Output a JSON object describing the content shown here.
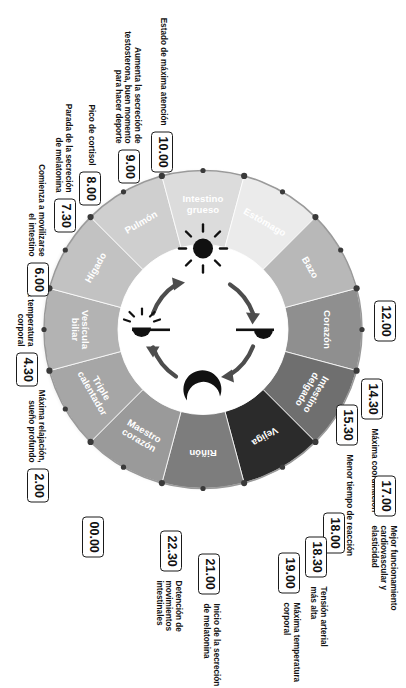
{
  "diagram": {
    "wheel": {
      "segments": [
        {
          "organ": "Corazón",
          "start_hour": 11,
          "end_hour": 13,
          "color": "#8f8f8f"
        },
        {
          "organ": "Intestino delgado",
          "start_hour": 13,
          "end_hour": 15,
          "color": "#6f6f6f"
        },
        {
          "organ": "Vejiga",
          "start_hour": 15,
          "end_hour": 17,
          "color": "#2b2b2b"
        },
        {
          "organ": "Riñón",
          "start_hour": 17,
          "end_hour": 19,
          "color": "#7d7d7d"
        },
        {
          "organ": "Maestro corazón",
          "start_hour": 19,
          "end_hour": 21,
          "color": "#9a9a9a"
        },
        {
          "organ": "Triple calentador",
          "start_hour": 21,
          "end_hour": 23,
          "color": "#a6a6a6"
        },
        {
          "organ": "Vesícula biliar",
          "start_hour": 23,
          "end_hour": 1,
          "color": "#b3b3b3"
        },
        {
          "organ": "Hígado",
          "start_hour": 1,
          "end_hour": 3,
          "color": "#c2c2c2"
        },
        {
          "organ": "Pulmón",
          "start_hour": 3,
          "end_hour": 5,
          "color": "#cfcfcf"
        },
        {
          "organ": "Intestino grueso",
          "start_hour": 5,
          "end_hour": 7,
          "color": "#dcdcdc"
        },
        {
          "organ": "Estómago",
          "start_hour": 7,
          "end_hour": 9,
          "color": "#ebebeb"
        },
        {
          "organ": "Bazo",
          "start_hour": 9,
          "end_hour": 11,
          "color": "#b8b8b8"
        }
      ],
      "center_icons": [
        {
          "name": "sunset-icon",
          "position": "top"
        },
        {
          "name": "moon-icon",
          "position": "right"
        },
        {
          "name": "sunrise-icon",
          "position": "bottom"
        },
        {
          "name": "sun-icon",
          "position": "left"
        }
      ],
      "center_arrows": 4
    },
    "markers": [
      {
        "time": "12.00",
        "note": ""
      },
      {
        "time": "14.30",
        "note": "Máxima coordinación"
      },
      {
        "time": "15.30",
        "note": "Menor tiempo de reacción"
      },
      {
        "time": "17.00",
        "note": "Mejor funcionamiento\ncardiovascular y\nelasticidad"
      },
      {
        "time": "18.00",
        "note": ""
      },
      {
        "time": "18.30",
        "note": "Tensión arterial\nmás alta"
      },
      {
        "time": "19.00",
        "note": "Máxima temperatura\ncorporal"
      },
      {
        "time": "21.00",
        "note": "Inicio de la secreción\nde melatonina"
      },
      {
        "time": "22.30",
        "note": "Detención de movimientos\nintestinales"
      },
      {
        "time": "00.00",
        "note": ""
      },
      {
        "time": "2.00",
        "note": "Máxima relajación,\nsueño profundo"
      },
      {
        "time": "4.30",
        "note": "Mínima temperatura\ncorporal"
      },
      {
        "time": "6.00",
        "note": "Comienza a movilizarse\nel intestino"
      },
      {
        "time": "7.30",
        "note": "Parada de la secreción\nde melatonina"
      },
      {
        "time": "8.00",
        "note": "Pico de cortisol"
      },
      {
        "time": "9.00",
        "note": "Aumenta la secreción de\ntestosterona, buen momento\npara hacer deporte"
      },
      {
        "time": "10.00",
        "note": "Estado de máxima atención"
      }
    ],
    "colors": {
      "ink": "#111111",
      "wheel_outline": "#8a8a8a",
      "dot": "#3a3a3a",
      "hub": "#ffffff",
      "arrow": "#4a4a4a",
      "background": "#ffffff"
    }
  }
}
